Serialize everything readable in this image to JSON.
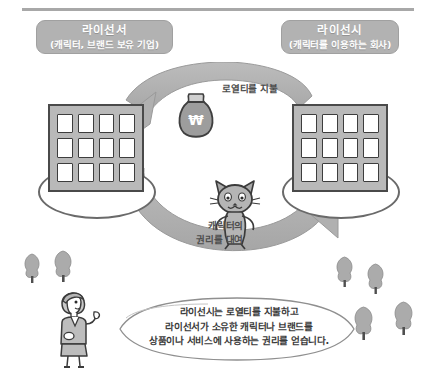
{
  "diagram": {
    "title_alt": "라이선싱 구조도",
    "parties": [
      {
        "id": "licensor",
        "name": "라이선서",
        "subtitle": "(캐릭터, 브랜드 보유 기업)",
        "icon": "office-building-icon"
      },
      {
        "id": "licensee",
        "name": "라이선시",
        "subtitle": "(캐릭터를 이용하는 회사)",
        "icon": "office-building-icon"
      }
    ],
    "flows": [
      {
        "id": "royalty-payment",
        "label": "로열티를 지불",
        "icon": "money-bag-icon",
        "symbol": "₩",
        "direction": "licensee-to-licensor"
      },
      {
        "id": "character-rights",
        "label_line1": "캐릭터의",
        "label_line2": "권리를 대여",
        "icon": "cat-character-icon",
        "direction": "licensor-to-licensee"
      }
    ],
    "speech_bubble": {
      "speaker_icon": "presenter-person-icon",
      "lines": [
        "라이선시는 로열티를 지불하고",
        "라이선서가 소유한 캐릭터나 브랜드를",
        "상품이나 서비스에 사용하는 권리를 얻습니다."
      ]
    },
    "decor": {
      "tree_icon": "tree-icon",
      "tree_count": 6
    },
    "colors": {
      "pill_fill": "#b2b2b2",
      "pill_text": "#ffffff",
      "building_fill": "#b9b9b9",
      "building_stroke": "#4a4a4a",
      "arrow_fill": "#b0b0b0",
      "label_text": "#4d4d4d",
      "bubble_text": "#3a3a3a",
      "rule": "#a8a8a8",
      "background": "#ffffff"
    }
  }
}
